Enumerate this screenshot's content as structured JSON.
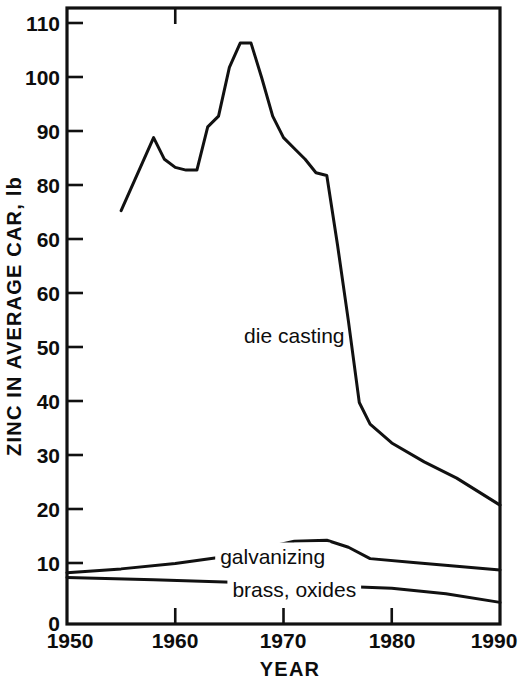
{
  "chart_data": {
    "type": "line",
    "title": "",
    "xlabel": "YEAR",
    "ylabel": "ZINC IN AVERAGE CAR, lb",
    "xlim": [
      1950,
      1990
    ],
    "ylim": [
      0,
      114
    ],
    "grid": false,
    "legend_position": "inline-annotations",
    "xticks": [
      1950,
      1960,
      1970,
      1980,
      1990
    ],
    "xtick_labels": [
      "1950",
      "1960",
      "1970",
      "1980",
      "1990"
    ],
    "yticks": [
      0,
      10,
      20,
      30,
      40,
      50,
      60,
      70,
      80,
      90,
      100,
      110
    ],
    "ytick_labels": [
      "0",
      "10",
      "20",
      "30",
      "40",
      "50",
      "60",
      "60",
      "80",
      "90",
      "100",
      "110"
    ],
    "series": [
      {
        "name": "die casting",
        "label": "die casting",
        "label_x": 1971,
        "label_y": 52,
        "x": [
          1955,
          1958,
          1959,
          1960,
          1961,
          1962,
          1963,
          1964,
          1965,
          1966,
          1967,
          1968,
          1969,
          1970,
          1971,
          1972,
          1973,
          1974,
          1975,
          1976,
          1977,
          1978,
          1980,
          1983,
          1986,
          1990
        ],
        "values": [
          76.5,
          90,
          86,
          84.5,
          84,
          84,
          92,
          94,
          103,
          107.5,
          107.5,
          101,
          94,
          90,
          88,
          86,
          83.5,
          83,
          70,
          56,
          41,
          37,
          33.5,
          30,
          27,
          22
        ]
      },
      {
        "name": "galvanizing",
        "label": "galvanizing",
        "label_x": 1969,
        "label_y": 11.2,
        "x": [
          1950,
          1955,
          1960,
          1965,
          1968,
          1971,
          1974,
          1976,
          1978,
          1982,
          1986,
          1990
        ],
        "values": [
          9.5,
          10.2,
          11.2,
          12.6,
          14.0,
          15.3,
          15.5,
          14.2,
          12.1,
          11.4,
          10.7,
          10.0
        ]
      },
      {
        "name": "brass, oxides",
        "label": "brass, oxides",
        "label_x": 1971,
        "label_y": 5.0,
        "x": [
          1950,
          1958,
          1966,
          1974,
          1980,
          1985,
          1990
        ],
        "values": [
          8.6,
          8.2,
          7.7,
          7.1,
          6.6,
          5.6,
          4.0
        ]
      }
    ]
  },
  "axes": {
    "y_title": "ZINC IN AVERAGE CAR, lb",
    "x_title": "YEAR"
  }
}
